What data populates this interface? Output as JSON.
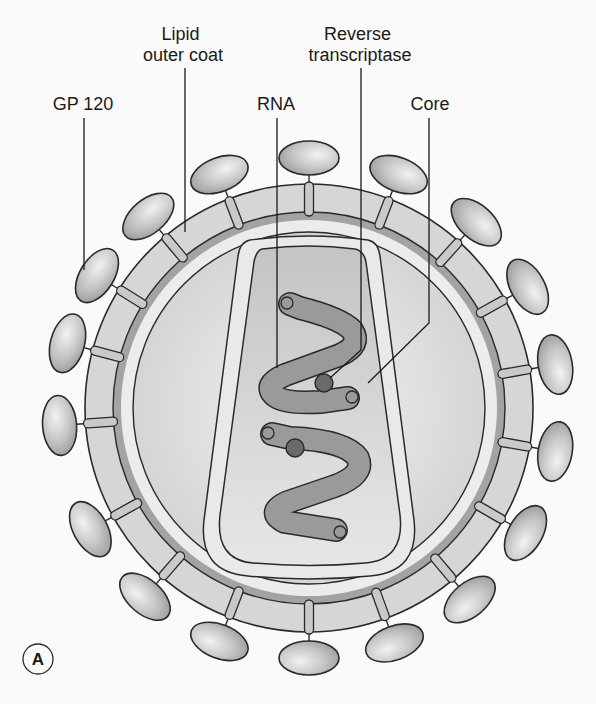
{
  "figure": {
    "panel_label": "A",
    "background": "#fafafa"
  },
  "labels": {
    "gp120": {
      "lines": [
        "GP 120"
      ],
      "x": 83,
      "y": 110,
      "leader": [
        [
          84,
          118
        ],
        [
          84,
          270
        ]
      ]
    },
    "lipid": {
      "lines": [
        "Lipid",
        "outer coat"
      ],
      "x": 183,
      "y": 40,
      "leader": [
        [
          185,
          68
        ],
        [
          185,
          232
        ]
      ]
    },
    "rna": {
      "lines": [
        "RNA"
      ],
      "x": 276,
      "y": 110,
      "leader": [
        [
          277,
          118
        ],
        [
          277,
          368
        ]
      ]
    },
    "reverse_transcriptase": {
      "lines": [
        "Reverse",
        "transcriptase"
      ],
      "x": 360,
      "y": 40,
      "leader": [
        [
          361,
          68
        ],
        [
          361,
          350
        ],
        [
          330,
          378
        ]
      ]
    },
    "core": {
      "lines": [
        "Core"
      ],
      "x": 430,
      "y": 110,
      "leader": [
        [
          429,
          118
        ],
        [
          429,
          323
        ],
        [
          368,
          383
        ]
      ]
    }
  },
  "virion": {
    "center": [
      309,
      408
    ],
    "outer_coat_radius": 224,
    "dark_band_outer_radius": 196,
    "dark_band_inner_radius": 188,
    "inner_membrane_radius": 176,
    "knob_stalk_inner_radius": 192,
    "knob_stalk_outer_radius": 226,
    "knob_center_radius": 250,
    "knob_rx": 30,
    "knob_ry": 17,
    "knob_angles_deg": [
      -90,
      -69,
      -48,
      -29,
      -10,
      10,
      30,
      50,
      70,
      90,
      111,
      131,
      151,
      176,
      -165,
      -148,
      -130,
      -111
    ],
    "colors": {
      "coat": "#d6d6d6",
      "dark_band": "#a3a3a3",
      "inner_gap": "#ececec",
      "interior": "#dcdcdc",
      "core_fill": "#c7c7c7",
      "rna": "#9a9a9a",
      "enzyme": "#6a6a6a",
      "knob": "#bdbdbd",
      "stroke": "#2a2a2a"
    }
  },
  "core": {
    "outer_path": "M 250 240 Q 309 232 368 240 Q 378 242 380 256 L 414 520 Q 420 572 370 576 Q 309 582 248 576 Q 198 572 204 520 L 238 256 Q 240 242 250 240 Z",
    "inner_path": "M 262 249 Q 309 243 355 249 Q 364 251 366 262 L 400 515 Q 405 560 365 563 Q 309 568 253 563 Q 215 560 220 515 L 254 262 Q 256 251 262 249 Z"
  },
  "rna_strands": [
    {
      "path": "M 290 304 L 300 308 Q 340 318 352 330 Q 362 345 340 355 L 285 375 Q 262 385 275 396 Q 285 404 320 402 L 348 398",
      "tip_start": [
        287,
        303
      ],
      "tip_end": [
        352,
        397
      ]
    },
    {
      "path": "M 272 434 L 290 438 Q 345 440 358 458 Q 365 475 335 486 L 288 502 Q 265 512 285 522 L 336 530",
      "tip_start": [
        268,
        433
      ],
      "tip_end": [
        340,
        532
      ]
    }
  ],
  "enzymes": [
    {
      "cx": 324,
      "cy": 383,
      "r": 9
    },
    {
      "cx": 295,
      "cy": 448,
      "r": 9
    }
  ],
  "panel_badge": {
    "cx": 38,
    "cy": 659,
    "r": 15
  }
}
